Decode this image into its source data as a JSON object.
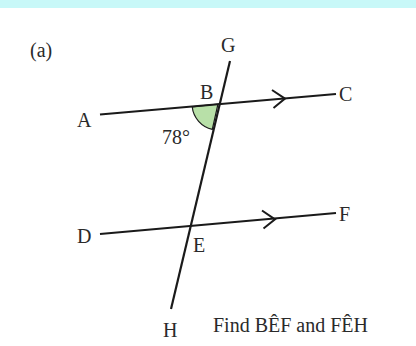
{
  "colors": {
    "top_band": "#c8f8f8",
    "line": "#1a1a1a",
    "angle_fill": "#b8e0a8",
    "text": "#2a2a2a"
  },
  "diagram": {
    "part_label": "(a)",
    "points": {
      "A": "A",
      "B": "B",
      "C": "C",
      "D": "D",
      "E": "E",
      "F": "F",
      "G": "G",
      "H": "H"
    },
    "angle_label": "78°",
    "question": "Find BÊF and FÊH"
  }
}
